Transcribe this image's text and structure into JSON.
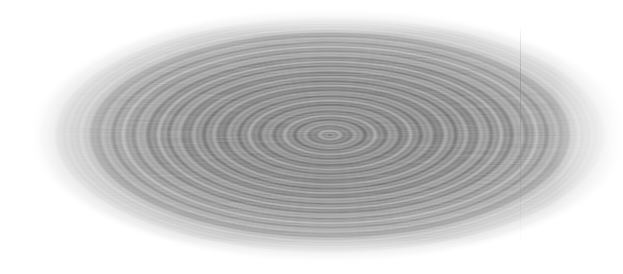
{
  "image": {
    "title": "Concentric elliptical ripple interference pattern",
    "subject": "ripple-wave-pattern",
    "modality": "grayscale",
    "width": 623,
    "height": 274,
    "background_color": "#ffffff",
    "notes": "No text, axes, labels, legends or UI chrome are present in the image."
  },
  "pattern": {
    "shape": "ellipse",
    "center_x": 330,
    "center_y": 135,
    "radius_x": 300,
    "radius_y": 128,
    "ring_count_coarse": 9,
    "ring_spacing_coarse_px": 36,
    "ring_spacing_fine_px": 7,
    "orientation": "horizontal major axis",
    "texture": "fine horizontal streaked noise"
  },
  "tones": {
    "background": "#ffffff",
    "highlight": "#e8e8e8",
    "midtone": "#9a9a9a",
    "core_gray": "#8c8c8c",
    "shadow": "#5a5a5a",
    "darkest": "#3c3c3c"
  },
  "artifacts": {
    "scanline": {
      "type": "vertical-line",
      "x": 520,
      "color": "#7d7d7d",
      "description": "faint vertical sensor/scan line artifact"
    }
  }
}
